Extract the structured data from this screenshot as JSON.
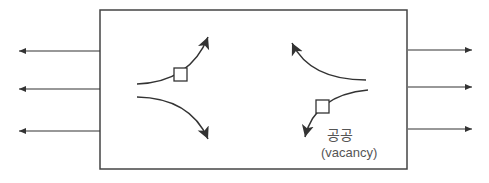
{
  "diagram": {
    "label_korean": "공공",
    "label_english": "(vacancy)",
    "colors": {
      "line": "#3a3a3a",
      "text": "#555555"
    }
  }
}
